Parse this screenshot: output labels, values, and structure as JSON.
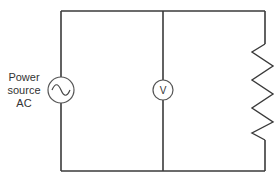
{
  "diagram": {
    "type": "circuit",
    "colors": {
      "wire": "#3a3a3a",
      "component_outline": "#555555",
      "text": "#333333",
      "background": "#ffffff"
    },
    "source": {
      "label_lines": [
        "Power",
        "source",
        "AC"
      ],
      "symbol": "ac-sine-icon"
    },
    "voltmeter": {
      "symbol_text": "V"
    },
    "resistor": {
      "symbol": "zigzag-resistor"
    }
  }
}
